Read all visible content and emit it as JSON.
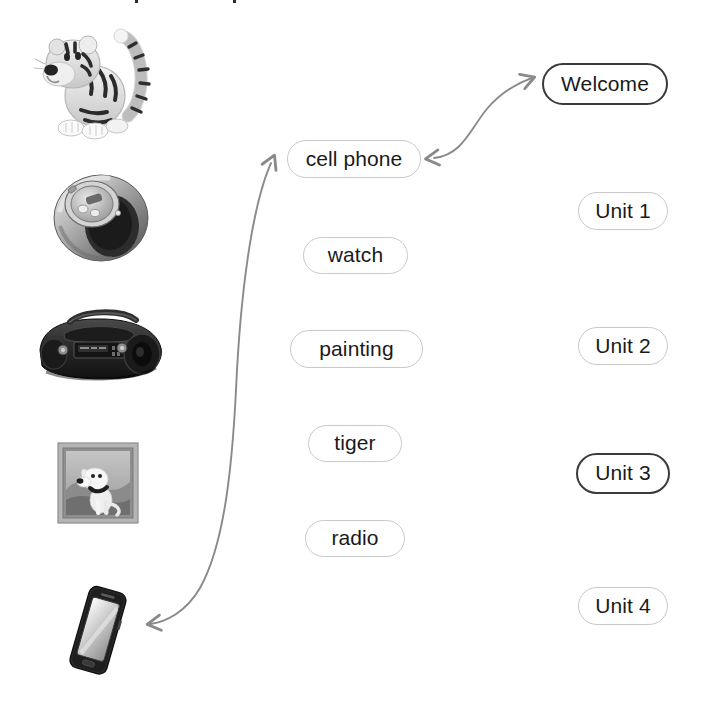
{
  "page": {
    "background_color": "#ffffff",
    "width": 702,
    "height": 709
  },
  "colors": {
    "pill_border_normal": "#c9c9c9",
    "pill_border_selected": "#3a3a3a",
    "pill_text": "#1a1a1a",
    "arrow": "#8a8a8a",
    "background": "#ffffff"
  },
  "word_column": {
    "name": "vocabulary-words",
    "items": [
      {
        "id": "cell-phone",
        "label": "cell phone",
        "selected": false,
        "x": 287,
        "y": 140,
        "w": 134,
        "h": 38
      },
      {
        "id": "watch",
        "label": "watch",
        "selected": false,
        "x": 303,
        "y": 237,
        "w": 105,
        "h": 37
      },
      {
        "id": "painting",
        "label": "painting",
        "selected": false,
        "x": 290,
        "y": 330,
        "w": 133,
        "h": 38
      },
      {
        "id": "tiger",
        "label": "tiger",
        "selected": false,
        "x": 308,
        "y": 425,
        "w": 94,
        "h": 37
      },
      {
        "id": "radio",
        "label": "radio",
        "selected": false,
        "x": 305,
        "y": 520,
        "w": 100,
        "h": 37
      }
    ]
  },
  "unit_column": {
    "name": "unit-labels",
    "items": [
      {
        "id": "welcome",
        "label": "Welcome",
        "selected": true,
        "x": 542,
        "y": 63,
        "w": 126,
        "h": 42
      },
      {
        "id": "unit-1",
        "label": "Unit 1",
        "selected": false,
        "x": 578,
        "y": 192,
        "w": 90,
        "h": 38
      },
      {
        "id": "unit-2",
        "label": "Unit 2",
        "selected": false,
        "x": 578,
        "y": 327,
        "w": 90,
        "h": 38
      },
      {
        "id": "unit-3",
        "label": "Unit 3",
        "selected": true,
        "x": 576,
        "y": 453,
        "w": 94,
        "h": 41
      },
      {
        "id": "unit-4",
        "label": "Unit 4",
        "selected": false,
        "x": 578,
        "y": 587,
        "w": 90,
        "h": 38
      }
    ]
  },
  "pictures": [
    {
      "id": "tiger-picture",
      "alt": "cartoon tiger sitting with raised striped tail",
      "x": 33,
      "y": 24,
      "w": 135,
      "h": 120
    },
    {
      "id": "watch-picture",
      "alt": "chunky metal wristwatch bangle",
      "x": 46,
      "y": 168,
      "w": 110,
      "h": 95
    },
    {
      "id": "radio-picture",
      "alt": "black portable boombox radio",
      "x": 30,
      "y": 306,
      "w": 140,
      "h": 82
    },
    {
      "id": "painting-picture",
      "alt": "framed painting of a white dog with collar",
      "x": 57,
      "y": 442,
      "w": 82,
      "h": 82
    },
    {
      "id": "cell-phone-picture",
      "alt": "black touchscreen smartphone tilted",
      "x": 57,
      "y": 580,
      "w": 80,
      "h": 100
    }
  ],
  "connectors": [
    {
      "id": "cellphone-to-welcome",
      "from": "cell phone",
      "to": "Welcome",
      "style": "double-headed curved arrow",
      "color": "#8a8a8a"
    },
    {
      "id": "cellphone-to-phone-picture",
      "from": "cell phone",
      "to": "cell-phone-picture",
      "style": "double-headed long curved arrow",
      "color": "#8a8a8a"
    }
  ],
  "artifacts": {
    "top_specks": [
      {
        "x": 135,
        "y": 0
      },
      {
        "x": 233,
        "y": 0
      }
    ]
  }
}
